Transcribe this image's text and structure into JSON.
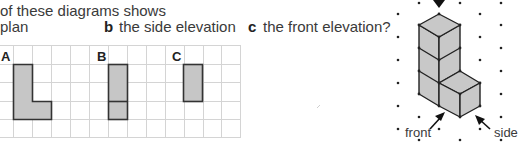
{
  "question": {
    "line1": "of these diagrams shows",
    "parts": [
      {
        "letter": "",
        "text": "plan"
      },
      {
        "letter": "b",
        "text": "the side elevation"
      },
      {
        "letter": "c",
        "text": "the front elevation?"
      }
    ]
  },
  "grid": {
    "labels": [
      "A",
      "B",
      "C"
    ],
    "line_color": "#d4d4d4",
    "fill_color": "#c6c6c6",
    "stroke_color": "#333333"
  },
  "iso_diagram": {
    "labels": {
      "front": "front",
      "side": "side"
    },
    "face_color": "#c8c8c8",
    "dot_color": "#222222"
  }
}
